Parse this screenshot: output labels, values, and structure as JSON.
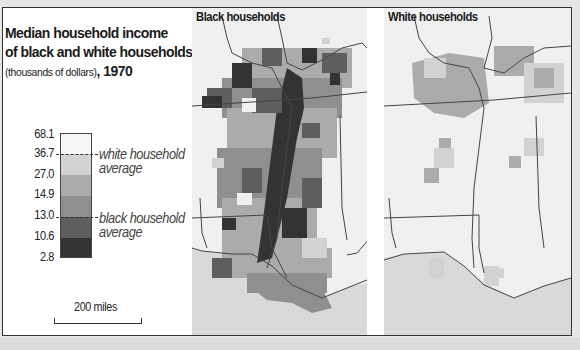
{
  "title": {
    "line1": "Median household income",
    "line2": "of black and white households",
    "subtitle": "(thousands of dollars)",
    "separator": ", ",
    "year": "1970"
  },
  "legend": {
    "ticks": [
      "68.1",
      "36.7",
      "27.0",
      "14.9",
      "13.0",
      "10.6",
      "2.8"
    ],
    "bins": [
      {
        "from": "36.7",
        "to": "68.1",
        "color": "#f7f7f7"
      },
      {
        "from": "27.0",
        "to": "36.7",
        "color": "#d2d2d2"
      },
      {
        "from": "14.9",
        "to": "27.0",
        "color": "#ababab"
      },
      {
        "from": "13.0",
        "to": "14.9",
        "color": "#8f8f8f"
      },
      {
        "from": "10.6",
        "to": "13.0",
        "color": "#5e5e5e"
      },
      {
        "from": "2.8",
        "to": "10.6",
        "color": "#333333"
      }
    ],
    "white_avg": {
      "value": "36.7",
      "line1": "white household",
      "line2": "average"
    },
    "black_avg": {
      "value": "13.0",
      "line1": "black household",
      "line2": "average"
    }
  },
  "scale": {
    "label": "200 miles"
  },
  "maps": [
    {
      "title": "Black households"
    },
    {
      "title": "White households"
    }
  ],
  "colors": {
    "land": "#f0f0f0",
    "water": "#d9d9d9",
    "border": "#444444",
    "frame": "#333333"
  }
}
